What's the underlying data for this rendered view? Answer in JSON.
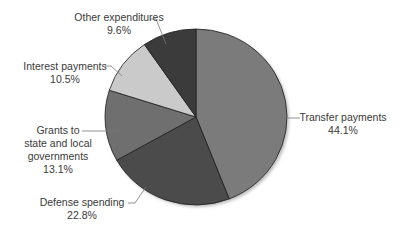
{
  "chart_data": {
    "type": "pie",
    "title": "",
    "start_angle_deg": 0,
    "direction": "clockwise",
    "slices": [
      {
        "label": "Transfer payments",
        "value": 44.1,
        "value_label": "44.1%",
        "color": "#7b7b7b"
      },
      {
        "label": "Defense spending",
        "value": 22.8,
        "value_label": "22.8%",
        "color": "#4b4b4b"
      },
      {
        "label": "Grants to state and local governments",
        "value": 13.1,
        "value_label": "13.1%",
        "color": "#6f6f6f"
      },
      {
        "label": "Interest payments",
        "value": 10.5,
        "value_label": "10.5%",
        "color": "#cacaca"
      },
      {
        "label": "Other expenditures",
        "value": 9.6,
        "value_label": "9.6%",
        "color": "#3b3b3b"
      }
    ],
    "categories": [
      "Transfer payments",
      "Defense spending",
      "Grants to state and local governments",
      "Interest payments",
      "Other expenditures"
    ],
    "values": [
      44.1,
      22.8,
      13.1,
      10.5,
      9.6
    ],
    "legend": "none (leader-line labels)"
  },
  "labels": {
    "transfer": {
      "name": "Transfer payments",
      "pct": "44.1%"
    },
    "defense": {
      "name": "Defense spending",
      "pct": "22.8%"
    },
    "grants": {
      "line1": "Grants to",
      "line2": "state and local",
      "line3": "governments",
      "pct": "13.1%"
    },
    "interest": {
      "name": "Interest payments",
      "pct": "10.5%"
    },
    "other": {
      "name": "Other expenditures",
      "pct": "9.6%"
    }
  }
}
